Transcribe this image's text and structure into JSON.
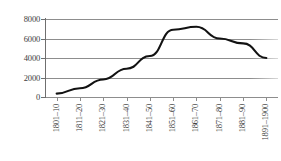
{
  "chart_data": {
    "type": "line",
    "title": "",
    "xlabel": "",
    "ylabel": "",
    "categories": [
      "1801–10",
      "1811–20",
      "1821–30",
      "1831–40",
      "1841–50",
      "1851–60",
      "1861–70",
      "1871–80",
      "1881–90",
      "1891–1900"
    ],
    "values": [
      350,
      900,
      1800,
      2900,
      4200,
      6900,
      7200,
      6000,
      5500,
      4000
    ],
    "series": [
      {
        "name": "series-1",
        "values": [
          350,
          900,
          1800,
          2900,
          4200,
          6900,
          7200,
          6000,
          5500,
          4000
        ]
      }
    ],
    "ylim": [
      0,
      8000
    ],
    "yticks": [
      0,
      2000,
      4000,
      6000,
      8000
    ],
    "ytick_labels": [
      "0",
      "2000",
      "4000",
      "6000",
      "8000"
    ],
    "grid": true,
    "legend": false,
    "legend_position": "none",
    "line_color": "#121212",
    "grid_color": "#8d8d8d",
    "background_color": "#ffffff"
  }
}
